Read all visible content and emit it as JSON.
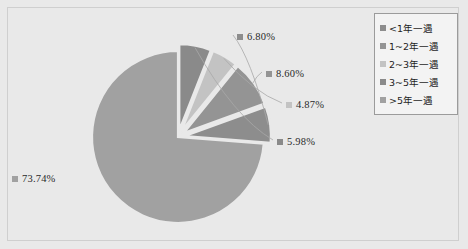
{
  "chart_data": {
    "type": "pie",
    "title": "",
    "categories": [
      "<1年一遇",
      "1~2年一遇",
      "2~3年一遇",
      "3~5年一遇",
      ">5年一遇"
    ],
    "values": [
      73.74,
      6.8,
      8.6,
      4.87,
      5.98
    ],
    "labels": [
      "73.74%",
      "6.80%",
      "8.60%",
      "4.87%",
      "5.98%"
    ],
    "colors": [
      "#a1a1a1",
      "#8d8d8d",
      "#949494",
      "#c3c3c3",
      "#8a8a8a"
    ],
    "exploded": [
      false,
      true,
      true,
      true,
      true
    ],
    "legend_position": "right",
    "grid": false,
    "background_color": "#e9e9e9",
    "label_text_color": "#2a2a2a",
    "leader_line_color": "#a8a8a8",
    "frame_color": "#cfcfcf",
    "legend_border_color": "#9b9b9b",
    "legend_background": "#f3f3f3"
  },
  "legend": {
    "items": [
      {
        "label": "<1年一遇",
        "swatch": "#8d8d8d"
      },
      {
        "label": "1~2年一遇",
        "swatch": "#949494"
      },
      {
        "label": "2~3年一遇",
        "swatch": "#c3c3c3"
      },
      {
        "label": "3~5年一遇",
        "swatch": "#8a8a8a"
      },
      {
        "label": ">5年一遇",
        "swatch": "#a1a1a1"
      }
    ]
  }
}
